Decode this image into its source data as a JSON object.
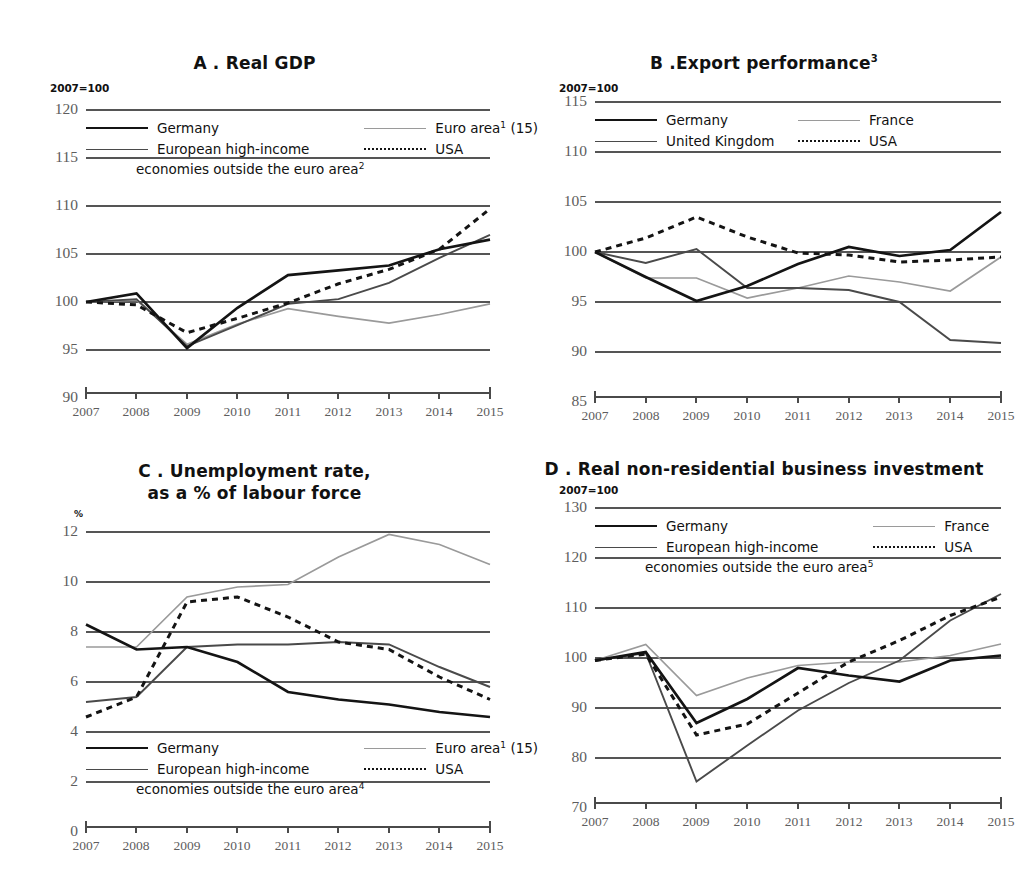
{
  "figure": {
    "background": "#ffffff",
    "colors": {
      "germany": "#141414",
      "european_high_income": "#4a4a4a",
      "united_kingdom": "#4a4a4a",
      "euro_area": "#9a9a9a",
      "france": "#9a9a9a",
      "usa": "#141414",
      "gridline": "#555555",
      "tick_text": "#5d5d5d"
    }
  },
  "panels": [
    {
      "id": "panel-a",
      "title": "A . Real GDP",
      "title_sup": "",
      "axis_unit": "2007=100",
      "legend": [
        {
          "label": "Germany",
          "sup": "",
          "style": "solid",
          "width": 2.6,
          "color": "#141414"
        },
        {
          "label": "Euro area",
          "sup": "1",
          "suffix": " (15)",
          "style": "solid",
          "width": 1.6,
          "color": "#9a9a9a"
        },
        {
          "label": "European high-income",
          "sup": "",
          "style": "solid",
          "width": 1.8,
          "color": "#4a4a4a"
        },
        {
          "label": "USA",
          "sup": "",
          "style": "dotted",
          "width": 2.4,
          "color": "#141414"
        }
      ],
      "legend_continuation": "economies outside the euro area",
      "legend_continuation_sup": "2"
    },
    {
      "id": "panel-b",
      "title": "B .Export performance",
      "title_sup": "3",
      "axis_unit": "2007=100",
      "legend": [
        {
          "label": "Germany",
          "sup": "",
          "style": "solid",
          "width": 2.6,
          "color": "#141414"
        },
        {
          "label": "France",
          "sup": "",
          "style": "solid",
          "width": 1.6,
          "color": "#9a9a9a"
        },
        {
          "label": "United Kingdom",
          "sup": "",
          "style": "solid",
          "width": 1.8,
          "color": "#4a4a4a"
        },
        {
          "label": "USA",
          "sup": "",
          "style": "dotted",
          "width": 2.4,
          "color": "#141414"
        }
      ],
      "legend_continuation": "",
      "legend_continuation_sup": ""
    },
    {
      "id": "panel-c",
      "title_line1": "C . Unemployment rate,",
      "title_line2": "as a % of labour force",
      "title": "C . Unemployment rate, as a % of labour force",
      "title_sup": "",
      "axis_unit": "%",
      "legend": [
        {
          "label": "Germany",
          "sup": "",
          "style": "solid",
          "width": 2.6,
          "color": "#141414"
        },
        {
          "label": "Euro area",
          "sup": "1",
          "suffix": " (15)",
          "style": "solid",
          "width": 1.6,
          "color": "#9a9a9a"
        },
        {
          "label": "European high-income",
          "sup": "",
          "style": "solid",
          "width": 1.8,
          "color": "#4a4a4a"
        },
        {
          "label": "USA",
          "sup": "",
          "style": "dotted",
          "width": 2.4,
          "color": "#141414"
        }
      ],
      "legend_continuation": "economies outside the euro area",
      "legend_continuation_sup": "4"
    },
    {
      "id": "panel-d",
      "title": "D . Real non-residential business investment",
      "title_sup": "",
      "axis_unit": "2007=100",
      "legend": [
        {
          "label": "Germany",
          "sup": "",
          "style": "solid",
          "width": 2.6,
          "color": "#141414"
        },
        {
          "label": "France",
          "sup": "",
          "style": "solid",
          "width": 1.6,
          "color": "#9a9a9a"
        },
        {
          "label": "European high-income",
          "sup": "",
          "style": "solid",
          "width": 1.8,
          "color": "#4a4a4a"
        },
        {
          "label": "USA",
          "sup": "",
          "style": "dotted",
          "width": 2.4,
          "color": "#141414"
        }
      ],
      "legend_continuation": "economies outside the euro area",
      "legend_continuation_sup": "5"
    }
  ],
  "chart_data": [
    {
      "type": "line",
      "panel": "A",
      "title": "A . Real GDP",
      "xlabel": "",
      "ylabel": "2007=100",
      "x": [
        2007,
        2008,
        2009,
        2010,
        2011,
        2012,
        2013,
        2014,
        2015
      ],
      "xticks": [
        "2007",
        "2008",
        "2009",
        "2010",
        "2011",
        "2012",
        "2013",
        "2014",
        "2015"
      ],
      "yticks": [
        90,
        95,
        100,
        105,
        110,
        115,
        120
      ],
      "ylim": [
        90,
        120
      ],
      "grid": true,
      "legend_position": "top-inside",
      "series": [
        {
          "name": "Germany",
          "style": "solid",
          "color": "#141414",
          "values": [
            100.0,
            100.9,
            95.2,
            99.4,
            102.8,
            103.3,
            103.8,
            105.5,
            106.5
          ]
        },
        {
          "name": "European high-income economies outside the euro area",
          "style": "solid",
          "color": "#4a4a4a",
          "values": [
            100.0,
            100.3,
            95.4,
            97.6,
            99.8,
            100.3,
            102.0,
            104.6,
            107.0
          ]
        },
        {
          "name": "Euro area (15)",
          "style": "solid",
          "color": "#9a9a9a",
          "values": [
            100.0,
            100.2,
            95.6,
            97.7,
            99.3,
            98.5,
            97.8,
            98.7,
            99.8
          ]
        },
        {
          "name": "USA",
          "style": "dotted",
          "color": "#141414",
          "values": [
            100.0,
            99.7,
            96.8,
            98.3,
            99.9,
            101.9,
            103.4,
            105.5,
            109.7
          ]
        }
      ]
    },
    {
      "type": "line",
      "panel": "B",
      "title": "B .Export performance",
      "xlabel": "",
      "ylabel": "2007=100",
      "x": [
        2007,
        2008,
        2009,
        2010,
        2011,
        2012,
        2013,
        2014,
        2015
      ],
      "xticks": [
        "2007",
        "2008",
        "2009",
        "2010",
        "2011",
        "2012",
        "2013",
        "2014",
        "2015"
      ],
      "yticks": [
        85,
        90,
        95,
        100,
        105,
        110,
        115
      ],
      "ylim": [
        85,
        115
      ],
      "grid": true,
      "legend_position": "top-inside",
      "series": [
        {
          "name": "Germany",
          "style": "solid",
          "color": "#141414",
          "values": [
            100.0,
            97.5,
            95.1,
            96.6,
            98.8,
            100.5,
            99.6,
            100.2,
            104.0
          ]
        },
        {
          "name": "United Kingdom",
          "style": "solid",
          "color": "#4a4a4a",
          "values": [
            100.0,
            98.9,
            100.3,
            96.4,
            96.4,
            96.2,
            95.0,
            91.2,
            90.9
          ]
        },
        {
          "name": "France",
          "style": "solid",
          "color": "#9a9a9a",
          "values": [
            100.0,
            97.4,
            97.4,
            95.4,
            96.4,
            97.6,
            97.0,
            96.1,
            99.5
          ]
        },
        {
          "name": "USA",
          "style": "dotted",
          "color": "#141414",
          "values": [
            100.0,
            101.4,
            103.5,
            101.5,
            99.9,
            99.7,
            99.0,
            99.2,
            99.5
          ]
        }
      ]
    },
    {
      "type": "line",
      "panel": "C",
      "title": "C . Unemployment rate, as a % of labour force",
      "xlabel": "",
      "ylabel": "%",
      "x": [
        2007,
        2008,
        2009,
        2010,
        2011,
        2012,
        2013,
        2014,
        2015
      ],
      "xticks": [
        "2007",
        "2008",
        "2009",
        "2010",
        "2011",
        "2012",
        "2013",
        "2014",
        "2015"
      ],
      "yticks": [
        0,
        2,
        4,
        6,
        8,
        10,
        12
      ],
      "ylim": [
        0,
        12
      ],
      "grid": true,
      "legend_position": "bottom-inside",
      "series": [
        {
          "name": "Germany",
          "style": "solid",
          "color": "#141414",
          "values": [
            8.3,
            7.3,
            7.4,
            6.8,
            5.6,
            5.3,
            5.1,
            4.8,
            4.6
          ]
        },
        {
          "name": "European high-income economies outside the euro area",
          "style": "solid",
          "color": "#4a4a4a",
          "values": [
            5.2,
            5.4,
            7.4,
            7.5,
            7.5,
            7.6,
            7.5,
            6.6,
            5.8
          ]
        },
        {
          "name": "Euro area (15)",
          "style": "solid",
          "color": "#9a9a9a",
          "values": [
            7.4,
            7.4,
            9.4,
            9.8,
            9.9,
            11.0,
            11.9,
            11.5,
            10.7
          ]
        },
        {
          "name": "USA",
          "style": "dotted",
          "color": "#141414",
          "values": [
            4.6,
            5.4,
            9.2,
            9.4,
            8.6,
            7.6,
            7.3,
            6.2,
            5.3
          ]
        }
      ]
    },
    {
      "type": "line",
      "panel": "D",
      "title": "D . Real non-residential business investment",
      "xlabel": "",
      "ylabel": "2007=100",
      "x": [
        2007,
        2008,
        2009,
        2010,
        2011,
        2012,
        2013,
        2014,
        2015
      ],
      "xticks": [
        "2007",
        "2008",
        "2009",
        "2010",
        "2011",
        "2012",
        "2013",
        "2014",
        "2015"
      ],
      "yticks": [
        70,
        80,
        90,
        100,
        110,
        120,
        130
      ],
      "ylim": [
        70,
        130
      ],
      "grid": true,
      "legend_position": "top-inside",
      "series": [
        {
          "name": "Germany",
          "style": "solid",
          "color": "#141414",
          "values": [
            99.5,
            101.2,
            87.0,
            91.8,
            98.0,
            96.5,
            95.3,
            99.5,
            100.5
          ]
        },
        {
          "name": "European high-income economies outside the euro area",
          "style": "solid",
          "color": "#4a4a4a",
          "values": [
            99.5,
            101.0,
            75.3,
            82.5,
            89.5,
            95.0,
            99.5,
            107.5,
            112.8
          ]
        },
        {
          "name": "France",
          "style": "solid",
          "color": "#9a9a9a",
          "values": [
            99.5,
            102.7,
            92.5,
            96.0,
            98.5,
            99.2,
            99.2,
            100.5,
            102.8
          ]
        },
        {
          "name": "USA",
          "style": "dotted",
          "color": "#141414",
          "values": [
            99.5,
            100.8,
            84.6,
            86.8,
            93.0,
            99.2,
            103.5,
            108.5,
            112.2
          ]
        }
      ]
    }
  ]
}
